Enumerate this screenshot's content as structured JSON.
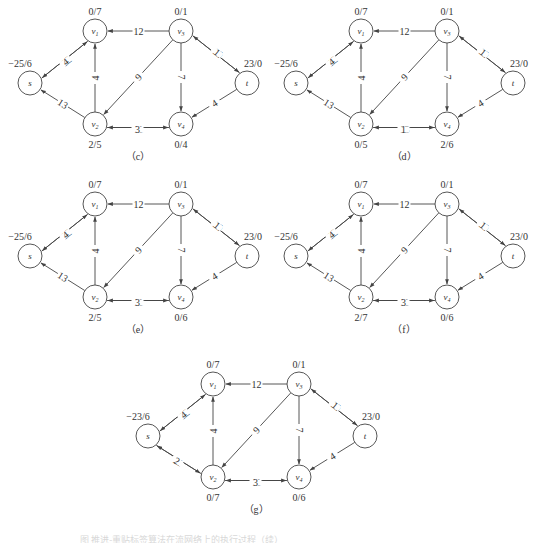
{
  "figure": {
    "node_ids": [
      "s",
      "v1",
      "v2",
      "v3",
      "v4",
      "t"
    ],
    "node_display": {
      "s": "s",
      "v1": "v1",
      "v2": "v2",
      "v3": "v3",
      "v4": "v4",
      "t": "t"
    },
    "colors": {
      "stroke": "#444444",
      "text": "#333333",
      "background": "#ffffff"
    }
  },
  "panels": [
    {
      "id": "c",
      "caption": "（c）",
      "node_values": {
        "s": "−25/6",
        "v1": "0/7",
        "v2": "2/5",
        "v3": "0/1",
        "v4": "0/4",
        "t": "23/0"
      },
      "edges": [
        {
          "from": "v1",
          "to": "s",
          "label": "12"
        },
        {
          "from": "s",
          "to": "v1",
          "label": "4"
        },
        {
          "from": "v3",
          "to": "v1",
          "label": "12"
        },
        {
          "from": "v2",
          "to": "v1",
          "label": "4"
        },
        {
          "from": "v2",
          "to": "s",
          "label": "13"
        },
        {
          "from": "v3",
          "to": "v2",
          "label": "9"
        },
        {
          "from": "v3",
          "to": "v4",
          "label": "7"
        },
        {
          "from": "t",
          "to": "v3",
          "label": "19"
        },
        {
          "from": "v3",
          "to": "t",
          "label": "1"
        },
        {
          "from": "t",
          "to": "v4",
          "label": "4"
        },
        {
          "from": "v4",
          "to": "v2",
          "label": "11"
        },
        {
          "from": "v2",
          "to": "v4",
          "label": "3"
        }
      ]
    },
    {
      "id": "d",
      "caption": "（d）",
      "node_values": {
        "s": "−25/6",
        "v1": "0/7",
        "v2": "0/5",
        "v3": "0/1",
        "v4": "2/6",
        "t": "23/0"
      },
      "edges": [
        {
          "from": "v1",
          "to": "s",
          "label": "12"
        },
        {
          "from": "s",
          "to": "v1",
          "label": "4"
        },
        {
          "from": "v3",
          "to": "v1",
          "label": "12"
        },
        {
          "from": "v2",
          "to": "v1",
          "label": "4"
        },
        {
          "from": "v2",
          "to": "s",
          "label": "13"
        },
        {
          "from": "v3",
          "to": "v2",
          "label": "9"
        },
        {
          "from": "v3",
          "to": "v4",
          "label": "7"
        },
        {
          "from": "t",
          "to": "v3",
          "label": "19"
        },
        {
          "from": "v3",
          "to": "t",
          "label": "1"
        },
        {
          "from": "t",
          "to": "v4",
          "label": "4"
        },
        {
          "from": "v4",
          "to": "v2",
          "label": "13"
        },
        {
          "from": "v2",
          "to": "v4",
          "label": "1"
        }
      ]
    },
    {
      "id": "e",
      "caption": "（e）",
      "node_values": {
        "s": "−25/6",
        "v1": "0/7",
        "v2": "2/5",
        "v3": "0/1",
        "v4": "0/6",
        "t": "23/0"
      },
      "edges": [
        {
          "from": "v1",
          "to": "s",
          "label": "12"
        },
        {
          "from": "s",
          "to": "v1",
          "label": "4"
        },
        {
          "from": "v3",
          "to": "v1",
          "label": "12"
        },
        {
          "from": "v2",
          "to": "v1",
          "label": "4"
        },
        {
          "from": "v2",
          "to": "s",
          "label": "13"
        },
        {
          "from": "v3",
          "to": "v2",
          "label": "9"
        },
        {
          "from": "v3",
          "to": "v4",
          "label": "7"
        },
        {
          "from": "t",
          "to": "v3",
          "label": "19"
        },
        {
          "from": "v3",
          "to": "t",
          "label": "1"
        },
        {
          "from": "t",
          "to": "v4",
          "label": "4"
        },
        {
          "from": "v4",
          "to": "v2",
          "label": "11"
        },
        {
          "from": "v2",
          "to": "v4",
          "label": "3"
        }
      ]
    },
    {
      "id": "f",
      "caption": "（f）",
      "node_values": {
        "s": "−25/6",
        "v1": "0/7",
        "v2": "2/7",
        "v3": "0/1",
        "v4": "0/6",
        "t": "23/0"
      },
      "edges": [
        {
          "from": "v1",
          "to": "s",
          "label": "12"
        },
        {
          "from": "s",
          "to": "v1",
          "label": "4"
        },
        {
          "from": "v3",
          "to": "v1",
          "label": "12"
        },
        {
          "from": "v2",
          "to": "v1",
          "label": "4"
        },
        {
          "from": "v2",
          "to": "s",
          "label": "13"
        },
        {
          "from": "v3",
          "to": "v2",
          "label": "9"
        },
        {
          "from": "v3",
          "to": "v4",
          "label": "7"
        },
        {
          "from": "t",
          "to": "v3",
          "label": "19"
        },
        {
          "from": "v3",
          "to": "t",
          "label": "1"
        },
        {
          "from": "t",
          "to": "v4",
          "label": "4"
        },
        {
          "from": "v4",
          "to": "v2",
          "label": "11"
        },
        {
          "from": "v2",
          "to": "v4",
          "label": "3"
        }
      ]
    },
    {
      "id": "g",
      "caption": "（g）",
      "node_values": {
        "s": "−23/6",
        "v1": "0/7",
        "v2": "0/7",
        "v3": "0/1",
        "v4": "0/6",
        "t": "23/0"
      },
      "edges": [
        {
          "from": "v1",
          "to": "s",
          "label": "12"
        },
        {
          "from": "s",
          "to": "v1",
          "label": "4"
        },
        {
          "from": "v3",
          "to": "v1",
          "label": "12"
        },
        {
          "from": "v2",
          "to": "v1",
          "label": "4"
        },
        {
          "from": "v2",
          "to": "s",
          "label": "11"
        },
        {
          "from": "s",
          "to": "v2",
          "label": "2"
        },
        {
          "from": "v3",
          "to": "v2",
          "label": "9"
        },
        {
          "from": "v3",
          "to": "v4",
          "label": "7"
        },
        {
          "from": "t",
          "to": "v3",
          "label": "19"
        },
        {
          "from": "v3",
          "to": "t",
          "label": "1"
        },
        {
          "from": "t",
          "to": "v4",
          "label": "4"
        },
        {
          "from": "v4",
          "to": "v2",
          "label": "11"
        },
        {
          "from": "v2",
          "to": "v4",
          "label": "3"
        }
      ]
    }
  ],
  "footnote": "图  推进-重贴标签算法在流网络上的执行过程（续）"
}
